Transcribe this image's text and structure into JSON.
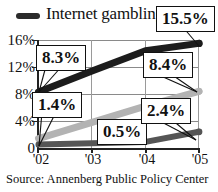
{
  "legend": {
    "series_label": "Internet gambling",
    "swatch_icon": "thick-line-swatch",
    "swatch_color": "#2b2b2b"
  },
  "axes": {
    "y_ticks": [
      "16%",
      "12%",
      "8%",
      "4%",
      "0"
    ],
    "y_values": [
      16,
      12,
      8,
      4,
      0
    ],
    "x_ticks": [
      "'02",
      "'03",
      "'04",
      "'05"
    ],
    "x_values": [
      "2002",
      "2003",
      "2004",
      "2005"
    ]
  },
  "callouts": [
    {
      "id": "callout-155",
      "label": "15.5%"
    },
    {
      "id": "callout-83",
      "label": "8.3%"
    },
    {
      "id": "callout-84",
      "label": "8.4%"
    },
    {
      "id": "callout-14",
      "label": "1.4%"
    },
    {
      "id": "callout-05",
      "label": "0.5%"
    },
    {
      "id": "callout-24",
      "label": "2.4%"
    }
  ],
  "source": {
    "text": "Source: Annenberg Public Policy Center"
  },
  "chart_data": {
    "type": "line",
    "title": "",
    "subtitle": "",
    "xlabel": "",
    "ylabel": "",
    "x": [
      "'02",
      "'03",
      "'04",
      "'05"
    ],
    "categories": [
      "'02",
      "'03",
      "'04",
      "'05"
    ],
    "ylim": [
      0,
      16
    ],
    "xlim": [
      "'02",
      "'05"
    ],
    "grid": "horizontal-and-vertical",
    "legend_position": "top-left",
    "series": [
      {
        "name": "Internet gambling",
        "color": "#1c1c1c",
        "values": [
          8.3,
          11.4,
          14.4,
          15.5
        ],
        "labeled_points": {
          "'02": "8.3%",
          "'05": "15.5%"
        }
      },
      {
        "name": "series-light-gray",
        "color": "#b3b3b3",
        "values": [
          1.4,
          3.8,
          6.2,
          8.4
        ],
        "labeled_points": {
          "'02": "1.4%",
          "'05": "8.4%"
        }
      },
      {
        "name": "series-dark-gray",
        "color": "#555555",
        "values": [
          0.5,
          0.7,
          0.9,
          2.4
        ],
        "labeled_points": {
          "'02": "0.5%",
          "'05": "2.4%"
        }
      }
    ]
  }
}
